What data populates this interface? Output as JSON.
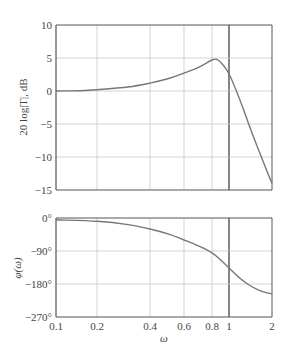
{
  "chart_data": [
    {
      "type": "line",
      "title": "",
      "xlabel": "",
      "ylabel": "20 log|T|, dB",
      "xscale": "log",
      "xlim": [
        0.1,
        2
      ],
      "ylim": [
        -15,
        10
      ],
      "grid": true,
      "x_ticks": [
        "0.1",
        "0.2",
        "0.4",
        "0.6",
        "0.8",
        "1",
        "2"
      ],
      "y_ticks": [
        "10",
        "5",
        "0",
        "−5",
        "−10",
        "−15"
      ],
      "series": [
        {
          "name": "magnitude",
          "x": [
            0.1,
            0.15,
            0.2,
            0.3,
            0.4,
            0.5,
            0.6,
            0.7,
            0.8,
            0.85,
            0.9,
            1.0,
            1.2,
            1.4,
            1.6,
            1.8,
            2.0
          ],
          "values": [
            0,
            0.05,
            0.2,
            0.6,
            1.2,
            1.9,
            2.7,
            3.6,
            4.7,
            4.8,
            4.3,
            2.6,
            -1.5,
            -5.5,
            -8.8,
            -11.6,
            -14
          ]
        }
      ]
    },
    {
      "type": "line",
      "title": "",
      "xlabel": "ω",
      "ylabel": "φ(ω)",
      "xscale": "log",
      "xlim": [
        0.1,
        2
      ],
      "ylim": [
        -270,
        0
      ],
      "grid": true,
      "x_ticks": [
        "0.1",
        "0.2",
        "0.4",
        "0.6",
        "0.8",
        "1",
        "2"
      ],
      "y_ticks": [
        "0°",
        "−90°",
        "−180°",
        "−270°"
      ],
      "series": [
        {
          "name": "phase",
          "x": [
            0.1,
            0.2,
            0.3,
            0.4,
            0.5,
            0.6,
            0.7,
            0.8,
            0.9,
            1.0,
            1.2,
            1.4,
            1.6,
            1.8,
            2.0
          ],
          "values": [
            -5,
            -9,
            -18,
            -30,
            -44,
            -60,
            -77,
            -95,
            -115,
            -136,
            -165,
            -184,
            -196,
            -203,
            -207
          ]
        }
      ]
    }
  ],
  "labels": {
    "mag_ylabel": "20 log|T|, dB",
    "phase_ylabel": "φ(ω)",
    "xlabel": "ω"
  },
  "colors": {
    "curve": "#777777",
    "grid": "#c8c8c8",
    "axis": "#555555",
    "unity_line": "#333333"
  }
}
